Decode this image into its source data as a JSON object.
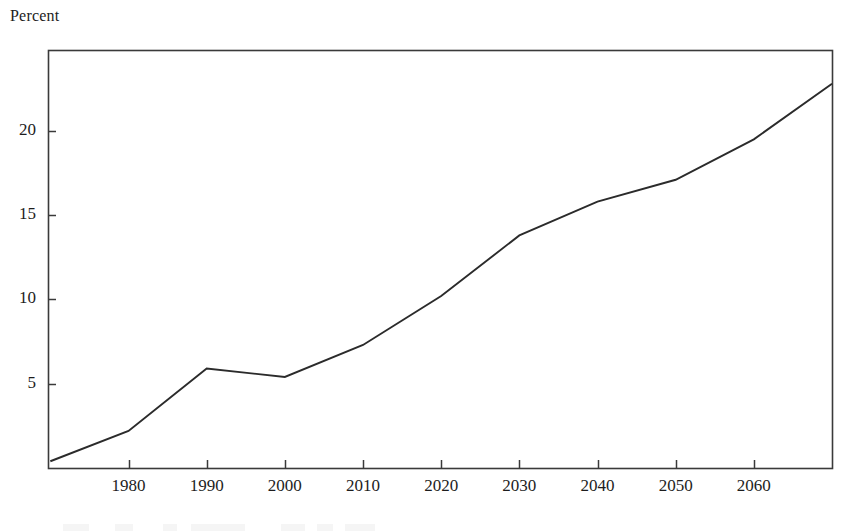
{
  "figure": {
    "axis_label_top": "Percent",
    "frame": {
      "left": 48,
      "right": 832,
      "top": 50,
      "bottom": 468
    },
    "line_color": "#2b2b2b",
    "frame_color": "#3a3a3a"
  },
  "chart_data": {
    "type": "line",
    "title": "",
    "subtitle": "",
    "xlabel": "",
    "ylabel": "Percent",
    "x": [
      1970,
      1980,
      1990,
      2000,
      2010,
      2020,
      2030,
      2040,
      2050,
      2060,
      2070
    ],
    "values": [
      0.4,
      2.2,
      5.9,
      5.4,
      7.3,
      10.2,
      13.8,
      15.8,
      17.1,
      19.5,
      22.8
    ],
    "series": [
      {
        "name": "Percent",
        "x": [
          1970,
          1980,
          1990,
          2000,
          2010,
          2020,
          2030,
          2040,
          2050,
          2060,
          2070
        ],
        "values": [
          0.4,
          2.2,
          5.9,
          5.4,
          7.3,
          10.2,
          13.8,
          15.8,
          17.1,
          19.5,
          22.8
        ]
      }
    ],
    "xlim": [
      1969.7,
      2070
    ],
    "ylim": [
      0,
      24.8
    ],
    "xticks": [
      1980,
      1990,
      2000,
      2010,
      2020,
      2030,
      2040,
      2050,
      2060
    ],
    "xtick_labels": [
      "1980",
      "1990",
      "2000",
      "2010",
      "2020",
      "2030",
      "2040",
      "2050",
      "2060"
    ],
    "yticks": [
      5,
      10,
      15,
      20
    ],
    "ytick_labels": [
      "5",
      "10",
      "15",
      "20"
    ],
    "grid": false,
    "legend": "none",
    "tick_direction": "in"
  }
}
